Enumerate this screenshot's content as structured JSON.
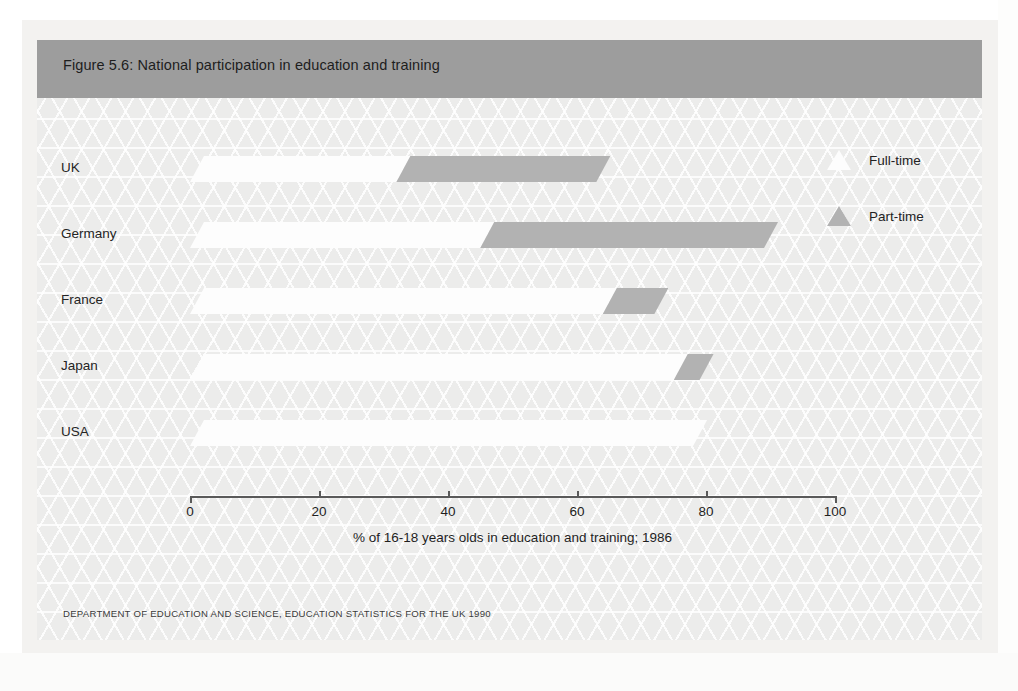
{
  "figure": {
    "title": "Figure 5.6: National participation in education and training",
    "source": "DEPARTMENT OF EDUCATION AND SCIENCE, EDUCATION STATISTICS FOR THE UK 1990",
    "title_bar_color": "#9d9d9d",
    "panel_color": "#ececeb"
  },
  "legend": {
    "items": [
      {
        "label": "Full-time",
        "color": "#fdfdfd",
        "marker": "triangle-icon"
      },
      {
        "label": "Part-time",
        "color": "#b2b2b2",
        "marker": "triangle-icon"
      }
    ]
  },
  "chart_data": {
    "type": "bar",
    "orientation": "horizontal",
    "stacked": true,
    "title": "Figure 5.6: National participation in education and training",
    "xlabel": "% of 16-18 years olds in education and training; 1986",
    "ylabel": "",
    "categories": [
      "UK",
      "Germany",
      "France",
      "Japan",
      "USA"
    ],
    "series": [
      {
        "name": "Full-time",
        "color": "#fdfdfd",
        "values": [
          32,
          45,
          64,
          75,
          78
        ]
      },
      {
        "name": "Part-time",
        "color": "#b2b2b2",
        "values": [
          31,
          44,
          8,
          4,
          0
        ]
      }
    ],
    "totals": [
      63,
      89,
      72,
      79,
      78
    ],
    "xlim": [
      0,
      100
    ],
    "xticks": [
      0,
      20,
      40,
      60,
      80,
      100
    ],
    "xtick_labels": [
      "0",
      "20",
      "40",
      "60",
      "80",
      "100"
    ],
    "grid": false,
    "legend_position": "right-top"
  }
}
